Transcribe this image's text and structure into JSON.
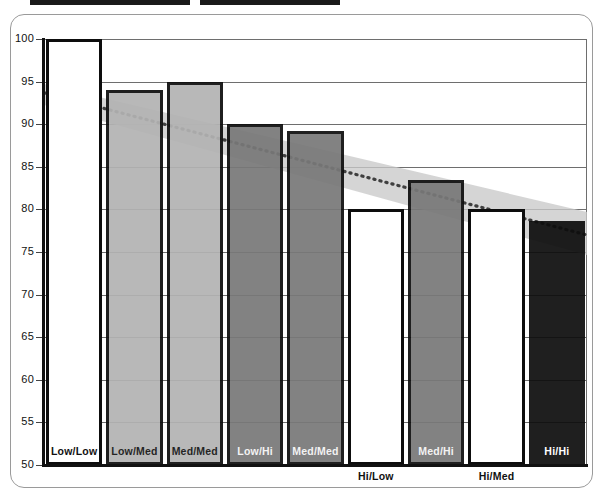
{
  "chart_data": {
    "type": "bar",
    "title": "",
    "subtitle": "",
    "xlabel": "",
    "ylabel": "",
    "ylim": [
      50,
      100
    ],
    "ytick_step": 5,
    "yticks": [
      "100",
      "95",
      "90",
      "85",
      "80",
      "75",
      "70",
      "65",
      "60",
      "55",
      "50"
    ],
    "grid": true,
    "legend_position": "none",
    "categories": [
      "Low/Low",
      "Low/Med",
      "Med/Med",
      "Low/Hi",
      "Med/Med",
      "Hi/Low",
      "Med/Hi",
      "Hi/Med",
      "Hi/Hi"
    ],
    "values": [
      100.0,
      94.0,
      95.0,
      90.0,
      89.2,
      80.0,
      83.5,
      80.0,
      78.6
    ],
    "bar_fills": [
      "white",
      "light-gray",
      "light-gray",
      "dark-gray",
      "dark-gray",
      "white",
      "dark-gray",
      "white",
      "black"
    ],
    "label_inside": [
      true,
      true,
      true,
      true,
      true,
      false,
      true,
      false,
      true
    ],
    "series": [
      {
        "name": "bars",
        "values": [
          100.0,
          94.0,
          95.0,
          90.0,
          89.2,
          80.0,
          83.5,
          80.0,
          78.6
        ]
      },
      {
        "name": "trend-line",
        "type": "line",
        "style": "dotted",
        "x": [
          0,
          100
        ],
        "values": [
          93.7,
          77.0
        ]
      },
      {
        "name": "trend-band",
        "type": "area",
        "x": [
          0,
          100
        ],
        "upper": [
          94.7,
          79.7
        ],
        "lower": [
          92.3,
          74.6
        ]
      }
    ]
  },
  "colors": {
    "bar_outline": "#0d0d0d",
    "fill_white": "#ffffff",
    "fill_light_gray": "#b3b3b3",
    "fill_dark_gray": "#787878",
    "fill_black": "#0d0d0d",
    "grid": "#6e6e6e",
    "axis": "#111111",
    "band": "#c9c9c9",
    "trend_line": "#4a4a4a",
    "card_border": "#9a9a9a"
  },
  "axis_labels": {
    "y": [
      "100",
      "95",
      "90",
      "85",
      "80",
      "75",
      "70",
      "65",
      "60",
      "55",
      "50"
    ]
  },
  "bars": [
    {
      "label": "Low/Low",
      "value": 100.0,
      "fill": "white",
      "inside": true
    },
    {
      "label": "Low/Med",
      "value": 94.0,
      "fill": "light-gray",
      "inside": true
    },
    {
      "label": "Med/Med",
      "value": 95.0,
      "fill": "light-gray",
      "inside": true
    },
    {
      "label": "Low/Hi",
      "value": 90.0,
      "fill": "dark-gray",
      "inside": true
    },
    {
      "label": "Med/Med",
      "value": 89.2,
      "fill": "dark-gray",
      "inside": true
    },
    {
      "label": "Hi/Low",
      "value": 80.0,
      "fill": "white",
      "inside": false
    },
    {
      "label": "Med/Hi",
      "value": 83.5,
      "fill": "dark-gray",
      "inside": true
    },
    {
      "label": "Hi/Med",
      "value": 80.0,
      "fill": "white",
      "inside": false
    },
    {
      "label": "Hi/Hi",
      "value": 78.6,
      "fill": "black",
      "inside": true
    }
  ]
}
